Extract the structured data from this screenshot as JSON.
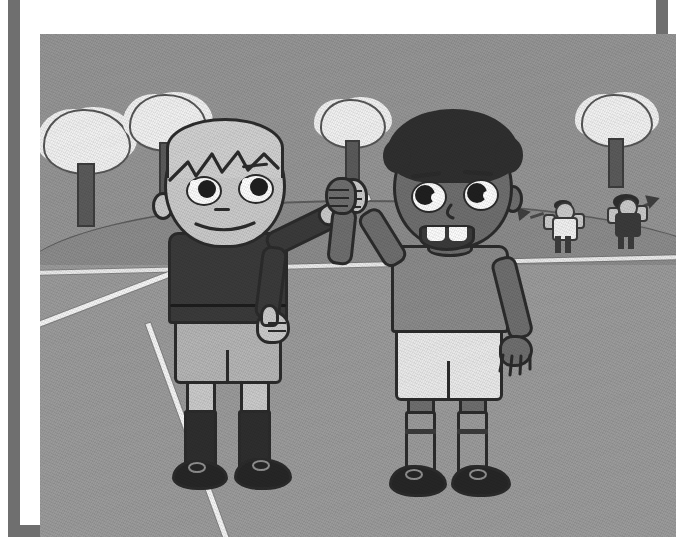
{
  "image": {
    "kind": "cartoon-illustration",
    "title": "Two boys high-fiving on a sports field",
    "description": "Grayscale cartoon drawing of two boys in sports kit giving a high five on a grass playing field, with trees and two cheering spectators waving pennants in the background.",
    "frame": {
      "style": "thick rectangular picture frame",
      "border_color": "#6f6f6f",
      "mat_color": "#ffffff",
      "border_width_px": 12
    },
    "palette": {
      "sky": "#949494",
      "grass_far": "#8d8d8d",
      "grass_near": "#9a9a9a",
      "field_line": "#f2f2f2",
      "outline": "#2b2b2b",
      "tree_canopy": "#f0f0f0",
      "tree_trunk": "#5a5a5a",
      "skin_light": "#c9c9c9",
      "skin_dark": "#6e6e6e",
      "hair_light": "#cfcfcf",
      "hair_dark": "#2f2f2f",
      "shirt_left": "#3a3a3a",
      "shorts_left": "#b4b4b4",
      "shirt_right": "#8a8a8a",
      "shorts_right": "#e8e8e8",
      "shoe": "#262626"
    },
    "scene": {
      "setting_label": "grass playing field",
      "sky_label": "overcast sky",
      "field_lines_label": "white painted field boundary lines",
      "horizon_label": "rolling hill horizon"
    },
    "trees": [
      {
        "name": "tree-left",
        "label": "background tree",
        "left_pct": 1.5,
        "top_pct": 16,
        "canopy_w": 84,
        "canopy_h": 60,
        "trunk_w": 14,
        "trunk_h": 54
      },
      {
        "name": "tree-left-mid",
        "label": "background tree",
        "left_pct": 15,
        "top_pct": 14,
        "canopy_w": 72,
        "canopy_h": 52,
        "trunk_w": 12,
        "trunk_h": 46
      },
      {
        "name": "tree-center",
        "label": "background tree",
        "left_pct": 45,
        "top_pct": 15,
        "canopy_w": 62,
        "canopy_h": 46,
        "trunk_w": 11,
        "trunk_h": 40
      },
      {
        "name": "tree-right",
        "label": "background tree",
        "left_pct": 85,
        "top_pct": 14,
        "canopy_w": 68,
        "canopy_h": 50,
        "trunk_w": 12,
        "trunk_h": 42
      }
    ],
    "spectators": [
      {
        "name": "spectator-left",
        "label": "cheering spectator waving a pennant",
        "shirt": "#f0f0f0",
        "hair": "#2e2e2e",
        "pants": "#3b3b3b",
        "left_pct": 80,
        "top_pct": 36
      },
      {
        "name": "spectator-right",
        "label": "cheering spectator waving a pennant",
        "shirt": "#3a3a3a",
        "hair": "#2e2e2e",
        "pants": "#3b3b3b",
        "left_pct": 90,
        "top_pct": 35
      }
    ],
    "characters": [
      {
        "name": "boy-left",
        "label": "light-skinned boy with light hair in a dark shirt",
        "skin": "#c9c9c9",
        "hair": "#cfcfcf",
        "hair_style": "short spiky fringe",
        "shirt": "#3a3a3a",
        "shorts": "#b4b4b4",
        "socks": "#2e2e2e",
        "shoes": "#262626",
        "expression": "smiling",
        "pose": "right arm raised for a high five, left arm down with thumbs-up"
      },
      {
        "name": "boy-right",
        "label": "dark-skinned boy with dark curly hair in a gray shirt",
        "skin": "#6e6e6e",
        "hair": "#2f2f2f",
        "hair_style": "short curly afro",
        "shirt": "#8a8a8a",
        "shorts": "#e8e8e8",
        "socks": "#8a8a8a",
        "shoes": "#262626",
        "expression": "open smile showing teeth",
        "pose": "left arm raised for a high five, right arm hanging down"
      }
    ],
    "interaction": {
      "name": "high-five-clasp",
      "label": "hands meeting in a high five"
    }
  }
}
